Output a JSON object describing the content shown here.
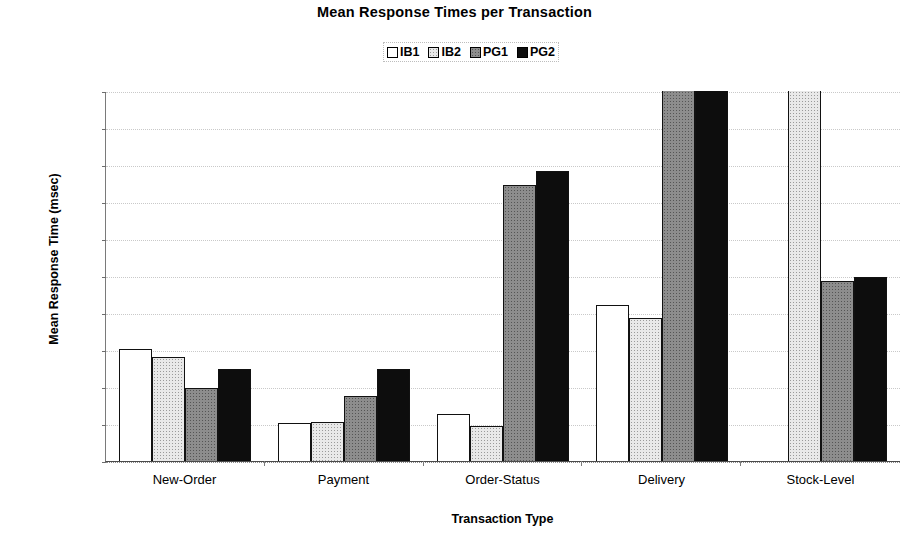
{
  "chart_data": {
    "type": "bar",
    "title": "Mean Response Times per Transaction",
    "xlabel": "Transaction Type",
    "ylabel": "Mean Response Time (msec)",
    "ylim": [
      0,
      1000
    ],
    "ytick_labels": [
      "1000",
      "900",
      "800",
      "700",
      "600",
      "500",
      "400",
      "300",
      "200",
      "100",
      "0"
    ],
    "yticks": [
      1000,
      900,
      800,
      700,
      600,
      500,
      400,
      300,
      200,
      100,
      0
    ],
    "grid": true,
    "legend_position": "top-center",
    "categories": [
      "New-Order",
      "Payment",
      "Order-Status",
      "Delivery",
      "Stock-Level"
    ],
    "series": [
      {
        "name": "IB1",
        "swatch": "white-open",
        "color": "#ffffff",
        "values": [
          303,
          103,
          127,
          422,
          0
        ],
        "clipped": [
          false,
          false,
          false,
          false,
          false
        ]
      },
      {
        "name": "IB2",
        "swatch": "light-dotted",
        "color": "#e9e9e9",
        "values": [
          282,
          105,
          95,
          387,
          1000
        ],
        "clipped": [
          false,
          false,
          false,
          false,
          true
        ]
      },
      {
        "name": "PG1",
        "swatch": "gray-dotted",
        "color": "#8d8d8d",
        "values": [
          197,
          176,
          745,
          1000,
          487
        ],
        "clipped": [
          false,
          false,
          false,
          true,
          false
        ]
      },
      {
        "name": "PG2",
        "swatch": "black-solid",
        "color": "#0d0d0d",
        "values": [
          250,
          249,
          785,
          1000,
          497
        ],
        "clipped": [
          false,
          false,
          false,
          true,
          false
        ]
      }
    ]
  }
}
